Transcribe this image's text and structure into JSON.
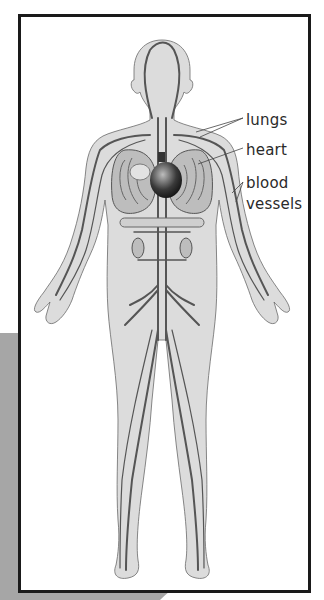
{
  "diagram": {
    "labels": {
      "lungs": "lungs",
      "heart": "heart",
      "blood": "blood",
      "vessels": "vessels"
    },
    "colors": {
      "frame": "#1a1a1a",
      "panel": "#a6a6a6",
      "skin": "#dcdcdc",
      "vessel": "#555555",
      "organ": "#8a8a8a",
      "text": "#2a2a2a"
    }
  }
}
